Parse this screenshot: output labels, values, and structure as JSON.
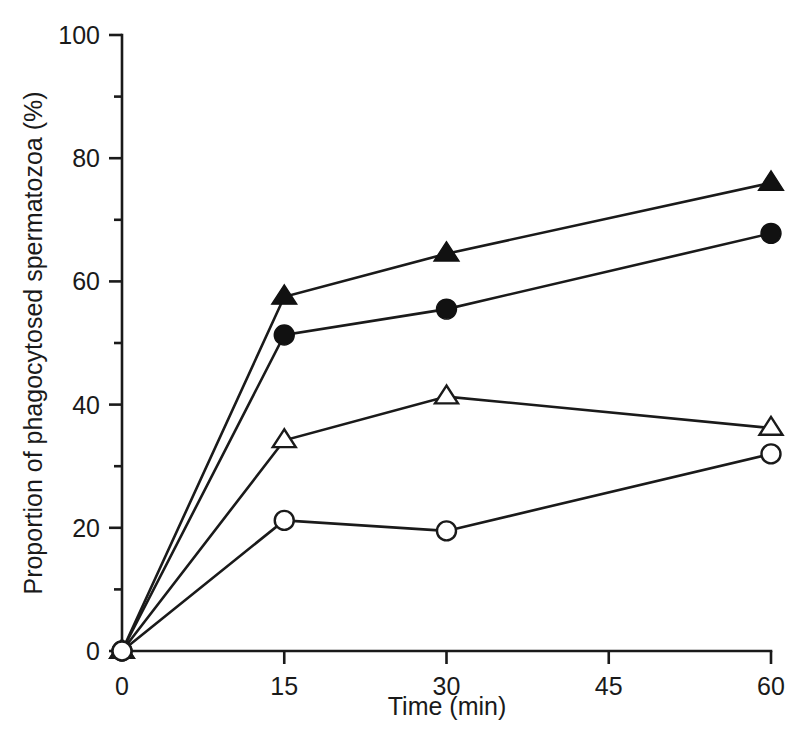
{
  "chart_data": {
    "type": "line",
    "title": "",
    "subtitle": "",
    "xlabel": "Time (min)",
    "ylabel": "Proportion of phagocytosed spermatozoa (%)",
    "x": [
      0,
      15,
      30,
      60
    ],
    "xlim": [
      0,
      60
    ],
    "ylim": [
      0,
      100
    ],
    "x_ticks": [
      0,
      15,
      30,
      45,
      60
    ],
    "x_tick_labels": [
      "0",
      "15",
      "30",
      "45",
      "60"
    ],
    "y_ticks": [
      0,
      20,
      40,
      60,
      80,
      100
    ],
    "y_tick_labels": [
      "0",
      "20",
      "40",
      "60",
      "80",
      "100"
    ],
    "y_minor_ticks": [
      10,
      30,
      50,
      70,
      90
    ],
    "grid": false,
    "legend": "none",
    "series": [
      {
        "name": "filled-triangle",
        "marker": "filled-triangle",
        "values": [
          0,
          57.5,
          64.5,
          76.0
        ]
      },
      {
        "name": "filled-circle",
        "marker": "filled-circle",
        "values": [
          0,
          51.3,
          55.5,
          67.8
        ]
      },
      {
        "name": "open-triangle",
        "marker": "open-triangle",
        "values": [
          0,
          34.2,
          41.3,
          36.2
        ]
      },
      {
        "name": "open-circle",
        "marker": "open-circle",
        "values": [
          0,
          21.2,
          19.5,
          32.0
        ]
      }
    ]
  }
}
